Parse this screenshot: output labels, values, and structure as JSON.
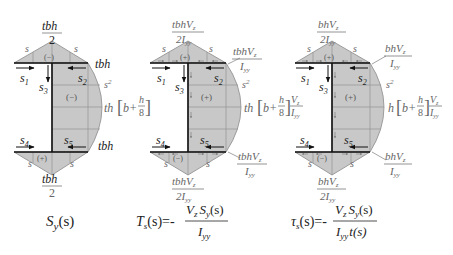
{
  "colors": {
    "shade": "#c8c8c8",
    "shade_stroke": "#8a8a8a",
    "line": "#1a1a1a",
    "label_gray": "#6a6a6a"
  },
  "diagrams": [
    {
      "id": "first-moment",
      "top_apex": {
        "num": "tbh",
        "den": "2"
      },
      "top_sign": "(−)",
      "flange_end_top": "tbh",
      "web_sign": "(−)",
      "web_peak_pre": "th",
      "web_peak_b": "b+",
      "web_peak_frac_num": "h",
      "web_peak_frac_den": "8",
      "web_peak_post": "",
      "bottom_sign": "(+)",
      "flange_end_bottom": "tbh",
      "bottom_apex": {
        "num": "tbh",
        "den": "2"
      },
      "s_labels": [
        "s₁",
        "s₂",
        "s₃",
        "s₄",
        "s₅"
      ],
      "s": "s",
      "s2": "s²",
      "caption": "S_y(s)"
    },
    {
      "id": "shear-flow",
      "top_apex": {
        "num": "tbhV_z",
        "den": "2I_yy"
      },
      "top_sign": "(+)",
      "flange_end_top": {
        "num": "tbhV_z",
        "den": "I_yy"
      },
      "web_sign": "(+)",
      "web_peak_pre": "th",
      "web_peak_b": "b+",
      "web_peak_frac_num": "h",
      "web_peak_frac_den": "8",
      "web_peak_post": {
        "num": "V_z",
        "den": "I_yy"
      },
      "bottom_sign": "(−)",
      "flange_end_bottom": {
        "num": "tbhV_z",
        "den": "I_yy"
      },
      "bottom_apex": {
        "num": "tbhV_z",
        "den": "2I_yy"
      },
      "caption": "T_s(s) = − V_z S_y(s) / I_yy"
    },
    {
      "id": "shear-stress",
      "top_apex": {
        "num": "bhV_z",
        "den": "2I_yy"
      },
      "top_sign": "(+)",
      "flange_end_top": {
        "num": "bhV_z",
        "den": "I_yy"
      },
      "web_sign": "(+)",
      "web_peak_pre": "h",
      "web_peak_b": "b+",
      "web_peak_frac_num": "h",
      "web_peak_frac_den": "8",
      "web_peak_post": {
        "num": "V_z",
        "den": "I_yy"
      },
      "bottom_sign": "(−)",
      "flange_end_bottom": {
        "num": "bhV_z",
        "den": "I_yy"
      },
      "bottom_apex": {
        "num": "bhV_z",
        "den": "2I_yy"
      },
      "caption": "τ_s(s) = − V_z S_y(s) / (I_yy t(s))"
    }
  ],
  "captions": {
    "c1_main": "S",
    "c1_sub": "y",
    "c1_arg": "(s)",
    "c2_lhs_main": "T",
    "c2_lhs_sub": "s",
    "c2_lhs_arg": "(s)=-",
    "c2_num": "V",
    "c2_num_sub": "z",
    "c2_num2": "S",
    "c2_num2_sub": "y",
    "c2_num_arg": "(s)",
    "c2_den": "I",
    "c2_den_sub": "yy",
    "c3_lhs_main": "τ",
    "c3_lhs_sub": "s",
    "c3_lhs_arg": "(s)=-",
    "c3_num": "V",
    "c3_num_sub": "z",
    "c3_num2": "S",
    "c3_num2_sub": "y",
    "c3_num_arg": "(s)",
    "c3_den": "I",
    "c3_den_sub": "yy",
    "c3_den_t": "t(s)"
  },
  "text": {
    "s": "s",
    "s_sq": "s",
    "sq": "2",
    "s1": "s",
    "s1_sub": "1",
    "s2": "s",
    "s2_sub": "2",
    "s3": "s",
    "s3_sub": "3",
    "s4": "s",
    "s4_sub": "4",
    "s5": "s",
    "s5_sub": "5",
    "d1_top_num": "tbh",
    "d1_top_den": "2",
    "d1_bot_num": "tbh",
    "d1_bot_den": "2",
    "d1_end_top": "tbh",
    "d1_end_bot": "tbh",
    "d1_peak_pre": "th",
    "d1_peak_b": "b+",
    "d1_peak_h": "h",
    "d1_peak_8": "8",
    "d1_sign_top": "(−)",
    "d1_sign_web": "(−)",
    "d1_sign_bot": "(+)",
    "d2_top_num": "tbhV",
    "d2_top_num_sub": "z",
    "d2_top_den": "2I",
    "d2_top_den_sub": "yy",
    "d2_end_num": "tbhV",
    "d2_end_num_sub": "z",
    "d2_end_den": "I",
    "d2_end_den_sub": "yy",
    "d2_peak_pre": "th",
    "d2_peak_b": "b+",
    "d2_peak_h": "h",
    "d2_peak_8": "8",
    "d2_peak_vnum": "V",
    "d2_peak_vnum_sub": "z",
    "d2_peak_vden": "I",
    "d2_peak_vden_sub": "yy",
    "d2_sign_top": "(+)",
    "d2_sign_web": "(+)",
    "d2_sign_bot": "(−)",
    "d3_top_num": "bhV",
    "d3_top_num_sub": "z",
    "d3_top_den": "2I",
    "d3_top_den_sub": "yy",
    "d3_end_num": "bhV",
    "d3_end_num_sub": "z",
    "d3_end_den": "I",
    "d3_end_den_sub": "yy",
    "d3_peak_pre": "h",
    "d3_peak_b": "b+",
    "d3_peak_h": "h",
    "d3_peak_8": "8",
    "d3_peak_vnum": "V",
    "d3_peak_vnum_sub": "z",
    "d3_peak_vden": "I",
    "d3_peak_vden_sub": "yy",
    "d3_sign_top": "(+)",
    "d3_sign_web": "(+)",
    "d3_sign_bot": "(−)"
  }
}
